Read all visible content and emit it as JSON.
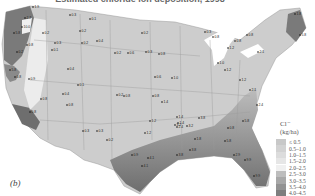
{
  "title": "Estimated chloride ion deposition, 1998",
  "panel_label": "(b)",
  "legend": {
    "title": "Cl⁻",
    "unit": "(kg/ha)",
    "classes": [
      {
        "label": "≤ 0.5",
        "color": "#c8c8c8"
      },
      {
        "label": "0.5–1.0",
        "color": "#d2d2d2"
      },
      {
        "label": "1.0–1.5",
        "color": "#dcdcdc"
      },
      {
        "label": "1.5–2.0",
        "color": "#e6e6e6"
      },
      {
        "label": "2.0–2.5",
        "color": "#f0f0f0"
      },
      {
        "label": "2.5–3.0",
        "color": "#bdbdbd"
      },
      {
        "label": "3.0–3.5",
        "color": "#a8a8a8"
      },
      {
        "label": "3.5–4.0",
        "color": "#939393"
      },
      {
        "label": "4.0–4.5",
        "color": "#7e7e7e"
      },
      {
        "label": "> 4.5",
        "color": "#666666"
      }
    ]
  },
  "map": {
    "region": "Contiguous United States",
    "stations": [
      {
        "x": 33,
        "y": 7,
        "value": "1.9"
      },
      {
        "x": 25,
        "y": 18,
        "value": "2.7"
      },
      {
        "x": 22,
        "y": 27,
        "value": "10.0"
      },
      {
        "x": 14,
        "y": 33,
        "value": "5.8"
      },
      {
        "x": 27,
        "y": 45,
        "value": "0.8"
      },
      {
        "x": 17,
        "y": 52,
        "value": "0.2"
      },
      {
        "x": 10,
        "y": 70,
        "value": "5.8"
      },
      {
        "x": 15,
        "y": 77,
        "value": "0.8"
      },
      {
        "x": 29,
        "y": 79,
        "value": "0.9"
      },
      {
        "x": 70,
        "y": 15,
        "value": "0.3"
      },
      {
        "x": 90,
        "y": 19,
        "value": "0.1"
      },
      {
        "x": 43,
        "y": 33,
        "value": "0.2"
      },
      {
        "x": 55,
        "y": 43,
        "value": "0.3"
      },
      {
        "x": 52,
        "y": 50,
        "value": "0.1"
      },
      {
        "x": 80,
        "y": 31,
        "value": "0.2"
      },
      {
        "x": 97,
        "y": 41,
        "value": "0.4"
      },
      {
        "x": 82,
        "y": 43,
        "value": "0.2"
      },
      {
        "x": 68,
        "y": 69,
        "value": "0.4"
      },
      {
        "x": 78,
        "y": 85,
        "value": "0.1"
      },
      {
        "x": 41,
        "y": 99,
        "value": "0.8"
      },
      {
        "x": 63,
        "y": 94,
        "value": "0.4"
      },
      {
        "x": 30,
        "y": 112,
        "value": "0.8"
      },
      {
        "x": 67,
        "y": 105,
        "value": "0.8"
      },
      {
        "x": 83,
        "y": 131,
        "value": "0.3"
      },
      {
        "x": 97,
        "y": 131,
        "value": "0.3"
      },
      {
        "x": 107,
        "y": 140,
        "value": "0.2"
      },
      {
        "x": 142,
        "y": 33,
        "value": "0.2"
      },
      {
        "x": 115,
        "y": 53,
        "value": "0.2"
      },
      {
        "x": 128,
        "y": 53,
        "value": "0.6"
      },
      {
        "x": 146,
        "y": 52,
        "value": "0.3"
      },
      {
        "x": 159,
        "y": 54,
        "value": "0.8"
      },
      {
        "x": 155,
        "y": 77,
        "value": "0.6"
      },
      {
        "x": 172,
        "y": 78,
        "value": "1.0"
      },
      {
        "x": 124,
        "y": 96,
        "value": "0.8"
      },
      {
        "x": 153,
        "y": 96,
        "value": "0.8"
      },
      {
        "x": 117,
        "y": 95,
        "value": "0.2"
      },
      {
        "x": 162,
        "y": 102,
        "value": "1.4"
      },
      {
        "x": 150,
        "y": 121,
        "value": "1.2"
      },
      {
        "x": 145,
        "y": 133,
        "value": "1.2"
      },
      {
        "x": 177,
        "y": 117,
        "value": "1.4"
      },
      {
        "x": 178,
        "y": 123,
        "value": "1.4"
      },
      {
        "x": 177,
        "y": 127,
        "value": "2.4"
      },
      {
        "x": 132,
        "y": 155,
        "value": "0.9"
      },
      {
        "x": 148,
        "y": 158,
        "value": "4.1"
      },
      {
        "x": 142,
        "y": 166,
        "value": "4.1"
      },
      {
        "x": 177,
        "y": 155,
        "value": "3.8"
      },
      {
        "x": 190,
        "y": 150,
        "value": "3.8"
      },
      {
        "x": 175,
        "y": 125,
        "value": "3.2"
      },
      {
        "x": 187,
        "y": 126,
        "value": "3.2"
      },
      {
        "x": 199,
        "y": 118,
        "value": "3.8"
      },
      {
        "x": 195,
        "y": 139,
        "value": "1.8"
      },
      {
        "x": 205,
        "y": 32,
        "value": "0.3"
      },
      {
        "x": 213,
        "y": 37,
        "value": "0.8"
      },
      {
        "x": 218,
        "y": 63,
        "value": "1.0"
      },
      {
        "x": 228,
        "y": 48,
        "value": "1.2"
      },
      {
        "x": 235,
        "y": 41,
        "value": "0.8"
      },
      {
        "x": 247,
        "y": 35,
        "value": "0.8"
      },
      {
        "x": 258,
        "y": 52,
        "value": "2.1"
      },
      {
        "x": 295,
        "y": 14,
        "value": "1.8"
      },
      {
        "x": 300,
        "y": 35,
        "value": "5.8"
      },
      {
        "x": 225,
        "y": 70,
        "value": "1.2"
      },
      {
        "x": 240,
        "y": 80,
        "value": "1.2"
      },
      {
        "x": 250,
        "y": 90,
        "value": "2.1"
      },
      {
        "x": 257,
        "y": 105,
        "value": "2.4"
      },
      {
        "x": 243,
        "y": 121,
        "value": "5.8"
      },
      {
        "x": 225,
        "y": 141,
        "value": "5.8"
      },
      {
        "x": 234,
        "y": 155,
        "value": "2.9"
      },
      {
        "x": 245,
        "y": 160,
        "value": "9.9"
      },
      {
        "x": 254,
        "y": 176,
        "value": "9.9"
      },
      {
        "x": 228,
        "y": 128,
        "value": "0.8"
      }
    ]
  }
}
